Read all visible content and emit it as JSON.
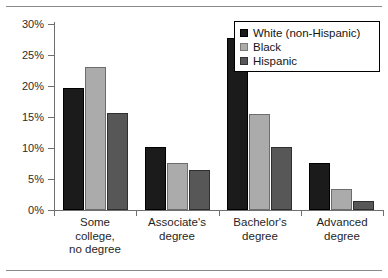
{
  "chart_data": {
    "type": "bar",
    "title": "",
    "subtitle": "",
    "xlabel": "",
    "ylabel": "",
    "categories": [
      "Some college, no degree",
      "Associate's degree",
      "Bachelor's degree",
      "Advanced degree"
    ],
    "category_lines": [
      [
        "Some",
        "college,",
        "no degree"
      ],
      [
        "Associate's",
        "degree"
      ],
      [
        "Bachelor's",
        "degree"
      ],
      [
        "Advanced",
        "degree"
      ]
    ],
    "series": [
      {
        "name": "White (non-Hispanic)",
        "color": "#1b1b1b",
        "values": [
          19.6,
          10.2,
          27.8,
          7.5
        ]
      },
      {
        "name": "Black",
        "color": "#ababab",
        "values": [
          23.0,
          7.5,
          15.5,
          3.4
        ]
      },
      {
        "name": "Hispanic",
        "color": "#575757",
        "values": [
          15.6,
          6.4,
          10.1,
          1.5
        ]
      }
    ],
    "ylim": [
      0,
      30
    ],
    "ytick_values": [
      0,
      5,
      10,
      15,
      20,
      25,
      30
    ],
    "ytick_labels": [
      "0%",
      "5%",
      "10%",
      "15%",
      "20%",
      "25%",
      "30%"
    ],
    "grid": false,
    "legend_position": "top-right",
    "legend_entries": [
      "White (non-Hispanic)",
      "Black",
      "Hispanic"
    ],
    "annotations": []
  },
  "figure": {
    "top_rule": "",
    "bottom_rule": ""
  }
}
